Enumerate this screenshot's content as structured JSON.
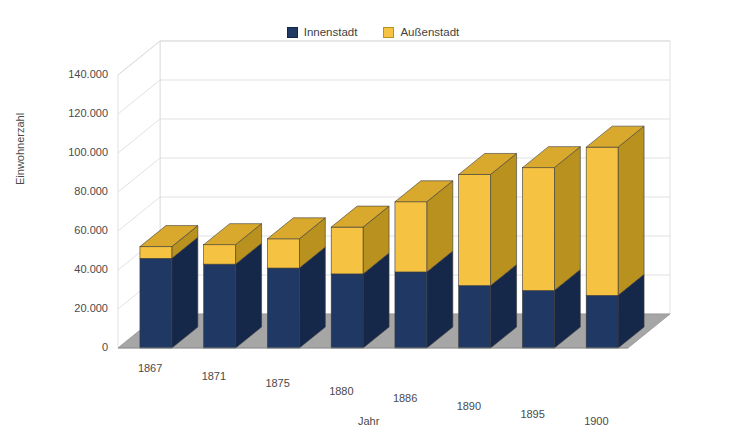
{
  "chart_data": {
    "type": "bar",
    "subtype": "stacked-column-3d",
    "title": "",
    "xlabel": "Jahr",
    "ylabel": "Einwohnerzahl",
    "categories": [
      "1867",
      "1871",
      "1875",
      "1880",
      "1886",
      "1890",
      "1895",
      "1900"
    ],
    "series": [
      {
        "name": "Innenstadt",
        "color": "#1f3864",
        "values": [
          46000,
          43000,
          41000,
          38000,
          39000,
          32000,
          29500,
          27000
        ]
      },
      {
        "name": "Außenstadt",
        "color": "#f5c242",
        "values": [
          6000,
          10000,
          15000,
          24000,
          36000,
          57000,
          63000,
          76000
        ]
      }
    ],
    "totals": [
      52000,
      53000,
      56000,
      62000,
      75000,
      89000,
      92500,
      103000
    ],
    "ylim": [
      0,
      140000
    ],
    "ytick_values": [
      0,
      20000,
      40000,
      60000,
      80000,
      100000,
      120000,
      140000
    ],
    "ytick_labels": [
      "0",
      "20.000",
      "40.000",
      "60.000",
      "80.000",
      "100.000",
      "120.000",
      "140.000"
    ],
    "grid": true,
    "legend_position": "top",
    "legend_entries": [
      "Innenstadt",
      "Außenstadt"
    ]
  },
  "legend": {
    "items": [
      {
        "label": "Innenstadt",
        "swatch": "legend-swatch-innenstadt"
      },
      {
        "label": "Außenstadt",
        "swatch": "legend-swatch-aussenstadt"
      }
    ]
  },
  "axes": {
    "y_title": "Einwohnerzahl",
    "x_title": "Jahr"
  },
  "colors": {
    "inner_front": "#1f3864",
    "inner_side": "#16284a",
    "inner_top": "#2a4a80",
    "outer_front": "#f5c242",
    "outer_side": "#b8911f",
    "outer_top": "#d9a92e",
    "floor": "#a6a6a6",
    "grid": "#d9d9d9",
    "wall": "#ffffff",
    "text": "#4a4a4a"
  }
}
